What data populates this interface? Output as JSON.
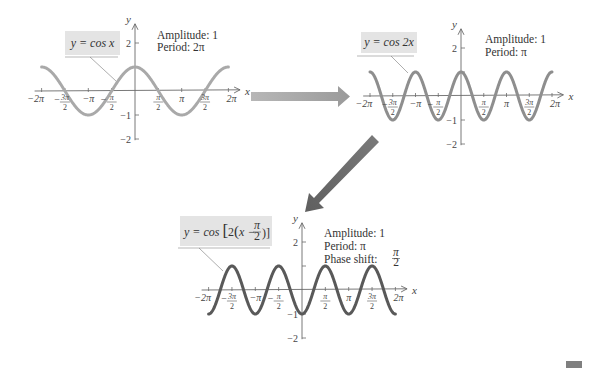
{
  "chart_data": [
    {
      "type": "line",
      "title": "y = cos x",
      "equation": "y = cos x",
      "annotations": [
        "Amplitude:  1",
        "Period:  2π"
      ],
      "xlabel": "x",
      "ylabel": "y",
      "xlim": [
        -6.5,
        6.6
      ],
      "ylim": [
        -2.8,
        2.8
      ],
      "x_ticks": [
        "−2π",
        "−3π/2",
        "−π",
        "−π/2",
        "π/2",
        "π",
        "3π/2",
        "2π"
      ],
      "y_ticks": [
        "2",
        "−1",
        "−2"
      ],
      "series": [
        {
          "name": "cos x",
          "function": "cos(x)",
          "domain": [
            -6.28,
            6.28
          ],
          "color": "#a8a8a8"
        }
      ],
      "key_points": {
        "x": [
          -6.283,
          -3.142,
          0,
          3.142,
          6.283
        ],
        "y": [
          1,
          -1,
          1,
          -1,
          1
        ]
      }
    },
    {
      "type": "line",
      "title": "y = cos 2x",
      "equation": "y = cos 2x",
      "annotations": [
        "Amplitude:  1",
        "Period:  π"
      ],
      "xlabel": "x",
      "ylabel": "y",
      "xlim": [
        -6.5,
        6.6
      ],
      "ylim": [
        -2.8,
        2.8
      ],
      "x_ticks": [
        "−2π",
        "−3π/2",
        "−π",
        "−π/2",
        "π/2",
        "π",
        "3π/2",
        "2π"
      ],
      "y_ticks": [
        "2",
        "−1",
        "−2"
      ],
      "series": [
        {
          "name": "cos 2x",
          "function": "cos(2x)",
          "domain": [
            -6.28,
            6.28
          ],
          "color": "#8c8c8c"
        }
      ],
      "key_points": {
        "x": [
          -6.283,
          -4.712,
          -3.142,
          -1.571,
          0,
          1.571,
          3.142,
          4.712,
          6.283
        ],
        "y": [
          1,
          -1,
          1,
          -1,
          1,
          -1,
          1,
          -1,
          1
        ]
      }
    },
    {
      "type": "line",
      "title": "y = cos[2(x − π/2)]",
      "equation_parts": {
        "prefix": "y = cos ",
        "inner": "2(x −",
        "frac_num": "π",
        "frac_den": "2",
        "suffix": ")]"
      },
      "annotations": [
        "Amplitude:  1",
        "Period:  π",
        "Phase shift:"
      ],
      "phase_shift": {
        "num": "π",
        "den": "2"
      },
      "xlabel": "x",
      "ylabel": "y",
      "xlim": [
        -6.5,
        6.6
      ],
      "ylim": [
        -2.8,
        2.8
      ],
      "x_ticks": [
        "−2π",
        "−3π/2",
        "−π",
        "−π/2",
        "π/2",
        "π",
        "3π/2",
        "2π"
      ],
      "y_ticks": [
        "2",
        "−1",
        "−2"
      ],
      "series": [
        {
          "name": "cos[2(x − π/2)]",
          "function": "cos(2(x - pi/2))",
          "domain": [
            -6.28,
            6.28
          ],
          "color": "#555555"
        }
      ],
      "key_points": {
        "x": [
          -6.283,
          -4.712,
          -3.142,
          -1.571,
          0,
          1.571,
          3.142,
          4.712,
          6.283
        ],
        "y": [
          -1,
          1,
          -1,
          1,
          -1,
          1,
          -1,
          1,
          -1
        ]
      }
    }
  ],
  "graphs": [
    {
      "equation": "y = cos x",
      "amplitude_label": "Amplitude:  1",
      "period_label": "Period:  2π"
    },
    {
      "equation": "y = cos 2x",
      "amplitude_label": "Amplitude:  1",
      "period_label": "Period:  π"
    },
    {
      "equation_prefix": "y = cos ",
      "equation_inner": "2",
      "equation_x": "x −",
      "frac_num": "π",
      "frac_den": "2",
      "amplitude_label": "Amplitude:  1",
      "period_label": "Period:  π",
      "phase_label": "Phase shift:",
      "phase_num": "π",
      "phase_den": "2"
    }
  ],
  "axis": {
    "x": "x",
    "y": "y",
    "two": "2",
    "neg_one": "−1",
    "neg_two": "−2",
    "neg_two_pi": "−2π",
    "neg_pi": "−π",
    "pi": "π",
    "two_pi": "2π",
    "three_pi": "3π",
    "pi_sym": "π",
    "den": "2",
    "minus": "−"
  },
  "colors": {
    "curve1": "#a9a9a9",
    "curve2": "#8e8e8e",
    "curve3": "#595959",
    "arrow1": "#a6a6a6",
    "arrow2": "#6f6f6f",
    "axis": "#6a6a6a",
    "label_box": "#e4e4e4"
  }
}
